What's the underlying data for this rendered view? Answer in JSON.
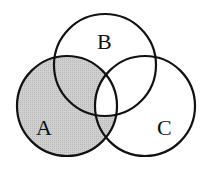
{
  "diagram": {
    "type": "venn",
    "sets": [
      {
        "name": "A",
        "cx": 67,
        "cy": 106,
        "r": 50
      },
      {
        "name": "B",
        "cx": 105,
        "cy": 65,
        "r": 51
      },
      {
        "name": "C",
        "cx": 145,
        "cy": 106,
        "r": 50
      }
    ],
    "labels": {
      "A": "A",
      "B": "B",
      "C": "C"
    },
    "shaded_region": "A minus (A ∩ B ∩ C)",
    "colors": {
      "shade": "#c8c8c8",
      "stroke": "#111111",
      "background": "#ffffff"
    }
  }
}
